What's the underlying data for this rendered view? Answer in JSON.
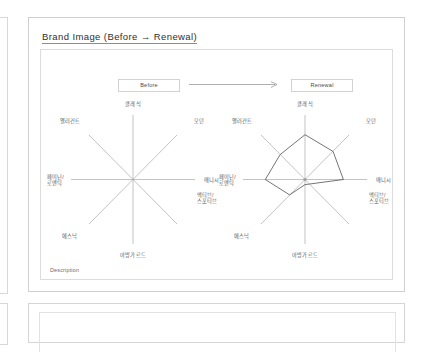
{
  "slide": {
    "title": "Brand Image (Before → Renewal)",
    "description_label": "Description"
  },
  "header": {
    "before_label": "Before",
    "renewal_label": "Renewal",
    "arrow_icon": "right-arrow-icon"
  },
  "colors": {
    "frame": "#cfcfcf",
    "inner_frame": "#dcdcdc",
    "axis": "#9a9a9a",
    "polygon_stroke": "#5c5c5c",
    "polygon_fill": "none",
    "title_rule": "#8e8e8e",
    "text": "#545454"
  },
  "chart_data": [
    {
      "type": "radar",
      "title": "Before",
      "categories": [
        "클래식",
        "모던",
        "매니시",
        "액티브/\n스포티브",
        "아방가르드",
        "에스닉",
        "페미닌/\n로맨틱",
        "엘러건트"
      ],
      "values": [
        0,
        0,
        0,
        0,
        0,
        0,
        0,
        0
      ],
      "rmax": 1.0,
      "grid": false,
      "legend": "none",
      "note": "Empty axes only — no plotted polygon"
    },
    {
      "type": "radar",
      "title": "Renewal",
      "categories": [
        "클래식",
        "모던",
        "매니시",
        "액티브/\n스포티브",
        "아방가르드",
        "에스닉",
        "페미닌/\n로맨틱",
        "엘러건트"
      ],
      "values": [
        0.7,
        0.62,
        0.6,
        0.1,
        0.08,
        0.34,
        0.62,
        0.55
      ],
      "rmax": 1.0,
      "grid": false,
      "legend": "none",
      "note": "Single closed polygon, outline only"
    }
  ],
  "axis_labels": {
    "classic": "클래식",
    "modern": "모던",
    "mannish": "매니시",
    "active_line1": "액티브/",
    "active_line2": "스포티브",
    "avantgarde": "아방가르드",
    "ethnic": "에스닉",
    "feminine_line1": "페미닌/",
    "feminine_line2": "로맨틱",
    "elegant": "엘러건트"
  }
}
